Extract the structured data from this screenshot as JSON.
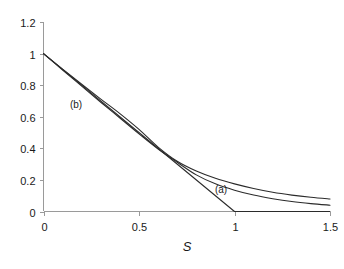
{
  "chart_data": {
    "type": "line",
    "title": "",
    "subtitle": "",
    "xlabel": "S",
    "ylabel": "",
    "xlim": [
      0,
      1.5
    ],
    "ylim": [
      0,
      1.2
    ],
    "grid": false,
    "legend_position": "inline-annotation",
    "x_ticks": [
      {
        "value": 0,
        "label": "0"
      },
      {
        "value": 0.5,
        "label": "0.5"
      },
      {
        "value": 1,
        "label": "1"
      },
      {
        "value": 1.5,
        "label": "1.5"
      }
    ],
    "y_ticks": [
      {
        "value": 0,
        "label": "0"
      },
      {
        "value": 0.2,
        "label": "0.2"
      },
      {
        "value": 0.4,
        "label": "0.4"
      },
      {
        "value": 0.6,
        "label": "0.6"
      },
      {
        "value": 0.8,
        "label": "0.8"
      },
      {
        "value": 1,
        "label": "1"
      },
      {
        "value": 1.2,
        "label": "1.2"
      }
    ],
    "annotations": [
      {
        "text": "(a)",
        "x": 0.93,
        "y": 0.12
      },
      {
        "text": "(b)",
        "x": 0.17,
        "y": 0.655
      }
    ],
    "series": [
      {
        "name": "upper-curve",
        "color": "#2b2b2b",
        "points": [
          [
            0.0,
            1.0
          ],
          [
            0.1,
            0.902
          ],
          [
            0.2,
            0.806
          ],
          [
            0.3,
            0.712
          ],
          [
            0.4,
            0.62
          ],
          [
            0.5,
            0.52
          ],
          [
            0.6,
            0.408
          ],
          [
            0.7,
            0.318
          ],
          [
            0.8,
            0.256
          ],
          [
            0.9,
            0.21
          ],
          [
            1.0,
            0.175
          ],
          [
            1.1,
            0.146
          ],
          [
            1.2,
            0.122
          ],
          [
            1.3,
            0.104
          ],
          [
            1.4,
            0.09
          ],
          [
            1.5,
            0.079
          ]
        ]
      },
      {
        "name": "lower-curve",
        "color": "#2b2b2b",
        "points": [
          [
            0.0,
            1.0
          ],
          [
            0.1,
            0.896
          ],
          [
            0.2,
            0.794
          ],
          [
            0.3,
            0.692
          ],
          [
            0.4,
            0.592
          ],
          [
            0.5,
            0.492
          ],
          [
            0.6,
            0.396
          ],
          [
            0.7,
            0.312
          ],
          [
            0.8,
            0.232
          ],
          [
            0.9,
            0.175
          ],
          [
            1.0,
            0.135
          ],
          [
            1.1,
            0.104
          ],
          [
            1.2,
            0.081
          ],
          [
            1.3,
            0.063
          ],
          [
            1.4,
            0.05
          ],
          [
            1.5,
            0.04
          ]
        ]
      },
      {
        "name": "piecewise-linear-curve",
        "color": "#2b2b2b",
        "points": [
          [
            0.0,
            1.0
          ],
          [
            0.62,
            0.38
          ],
          [
            1.0,
            0.0
          ],
          [
            1.5,
            0.0
          ]
        ]
      }
    ]
  }
}
